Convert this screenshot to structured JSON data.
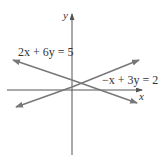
{
  "diagram": {
    "type": "coordinate-plane-lines",
    "axes": {
      "x_label": "x",
      "y_label": "y"
    },
    "lines": [
      {
        "equation": "2x + 6y = 5",
        "slope": "negative"
      },
      {
        "equation": "−x + 3y = 2",
        "slope": "positive"
      }
    ],
    "colors": {
      "axis": "#555555",
      "line": "#777777",
      "text": "#333333"
    }
  }
}
